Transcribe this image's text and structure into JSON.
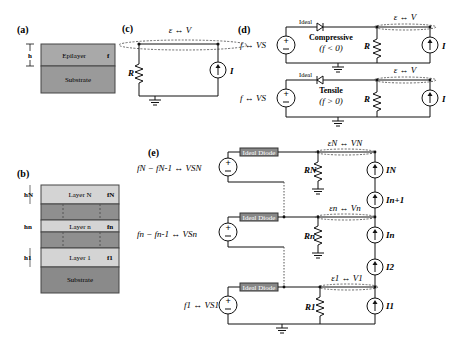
{
  "panels": {
    "a": {
      "label": "(a)",
      "height_label": "h",
      "layers": [
        {
          "name": "Epilayer",
          "strain": "f"
        },
        {
          "name": "Substrate"
        }
      ]
    },
    "b": {
      "label": "(b)",
      "layers": [
        {
          "name": "Layer N",
          "strain": "fN",
          "height": "hN"
        },
        {
          "name": "Layer n",
          "strain": "fn",
          "height": "hn"
        },
        {
          "name": "Layer 1",
          "strain": "f1",
          "height": "h1"
        },
        {
          "name": "Substrate"
        }
      ]
    },
    "c": {
      "label": "(c)",
      "mapping": "ε ↔ V",
      "resistor": "R",
      "current": "I"
    },
    "d": {
      "label": "(d)",
      "top": {
        "source": "f ↔ VS",
        "diode": "Ideal",
        "mode": "Compressive",
        "condition": "(f < 0)",
        "mapping": "ε ↔ V",
        "resistor": "R",
        "current": "I"
      },
      "bottom": {
        "source": "f ↔ VS",
        "diode": "Ideal",
        "mode": "Tensile",
        "condition": "(f > 0)",
        "mapping": "ε ↔ V",
        "resistor": "R",
        "current": "I"
      }
    },
    "e": {
      "label": "(e)",
      "stages": [
        {
          "source": "fN − fN-1 ↔ VSN",
          "diode": "Ideal Diode",
          "mapping": "εN ↔ VN",
          "resistor": "RN",
          "current": "IN"
        },
        {
          "source": "fn − fn-1 ↔ VSn",
          "diode": "Ideal Diode",
          "mapping": "εn ↔ Vn",
          "resistor": "Rn",
          "current": "In"
        },
        {
          "source": "f1 ↔ VS1",
          "diode": "Ideal Diode",
          "mapping": "ε1 ↔ V1",
          "resistor": "R1",
          "current": "I1"
        }
      ],
      "extra_currents": [
        "In+1",
        "I2"
      ]
    }
  }
}
